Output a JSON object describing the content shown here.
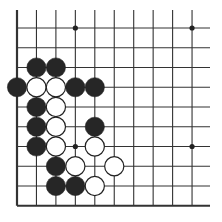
{
  "board": {
    "description": "Go problem diagram, lower-left corner region",
    "columns": 10,
    "rows": 10,
    "origin_x": 17,
    "origin_y": 28,
    "step_x": 19.45,
    "step_y": 19.75,
    "line_top": 10,
    "line_right": 210,
    "edges": [
      "left",
      "bottom"
    ],
    "line_color": "#333333",
    "stone_radius": 9.6,
    "colors": {
      "black": "#262626",
      "white": "#ffffff",
      "outline": "#222222"
    },
    "star_points": [
      [
        3,
        0
      ],
      [
        9,
        0
      ],
      [
        3,
        6
      ],
      [
        9,
        6
      ]
    ],
    "stones": [
      {
        "color": "black",
        "col": 1,
        "row": 2
      },
      {
        "color": "black",
        "col": 2,
        "row": 2
      },
      {
        "color": "black",
        "col": 0,
        "row": 3
      },
      {
        "color": "white",
        "col": 1,
        "row": 3
      },
      {
        "color": "white",
        "col": 2,
        "row": 3
      },
      {
        "color": "black",
        "col": 3,
        "row": 3
      },
      {
        "color": "black",
        "col": 4,
        "row": 3
      },
      {
        "color": "black",
        "col": 1,
        "row": 4
      },
      {
        "color": "white",
        "col": 2,
        "row": 4
      },
      {
        "color": "black",
        "col": 1,
        "row": 5
      },
      {
        "color": "white",
        "col": 2,
        "row": 5
      },
      {
        "color": "black",
        "col": 4,
        "row": 5
      },
      {
        "color": "black",
        "col": 1,
        "row": 6
      },
      {
        "color": "white",
        "col": 2,
        "row": 6
      },
      {
        "color": "white",
        "col": 4,
        "row": 6
      },
      {
        "color": "black",
        "col": 2,
        "row": 7
      },
      {
        "color": "white",
        "col": 3,
        "row": 7
      },
      {
        "color": "white",
        "col": 5,
        "row": 7
      },
      {
        "color": "black",
        "col": 2,
        "row": 8
      },
      {
        "color": "black",
        "col": 3,
        "row": 8
      },
      {
        "color": "white",
        "col": 4,
        "row": 8
      }
    ]
  }
}
